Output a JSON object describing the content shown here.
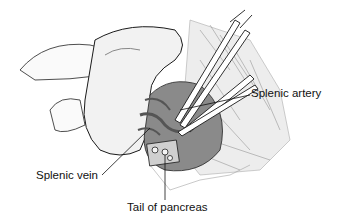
{
  "figure": {
    "labels": {
      "splenic_artery": "Splenic artery",
      "splenic_vein": "Splenic vein",
      "tail_of_pancreas": "Tail of pancreas"
    },
    "colors": {
      "ink": "#1a1a1a",
      "background": "#ffffff",
      "shade": "#9a9a9a"
    }
  }
}
